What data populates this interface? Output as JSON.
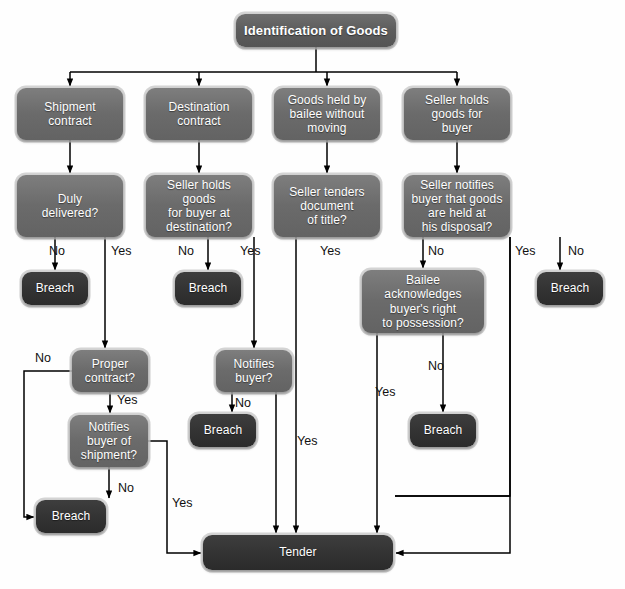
{
  "diagram": {
    "title_node": "Identification of Goods",
    "background": "#fefefe",
    "node_fill_gray": "#6b6b6b",
    "node_fill_dark": "#343434",
    "node_text_color": "#ffffff",
    "connector_color": "#000000"
  },
  "nodes": [
    {
      "id": "root",
      "label": "Identification of Goods",
      "style": "head",
      "x": 236,
      "y": 14,
      "w": 160,
      "h": 33,
      "font": 13
    },
    {
      "id": "b1",
      "label": "Shipment\ncontract",
      "style": "gray",
      "x": 17,
      "y": 88,
      "w": 106,
      "h": 52,
      "font": 12
    },
    {
      "id": "b2",
      "label": "Destination\ncontract",
      "style": "gray",
      "x": 146,
      "y": 88,
      "w": 106,
      "h": 52,
      "font": 12
    },
    {
      "id": "b3",
      "label": "Goods held by\nbailee without\nmoving",
      "style": "gray",
      "x": 274,
      "y": 88,
      "w": 106,
      "h": 52,
      "font": 12
    },
    {
      "id": "b4",
      "label": "Seller holds\ngoods for\nbuyer",
      "style": "gray",
      "x": 404,
      "y": 88,
      "w": 106,
      "h": 52,
      "font": 12
    },
    {
      "id": "q1",
      "label": "Duly\ndelivered?",
      "style": "gray",
      "x": 17,
      "y": 175,
      "w": 106,
      "h": 62,
      "font": 12
    },
    {
      "id": "q2",
      "label": "Seller holds goods\nfor buyer at\ndestination?",
      "style": "gray",
      "x": 146,
      "y": 175,
      "w": 106,
      "h": 62,
      "font": 12
    },
    {
      "id": "q3",
      "label": "Seller tenders\ndocument\nof title?",
      "style": "gray",
      "x": 274,
      "y": 175,
      "w": 106,
      "h": 62,
      "font": 12
    },
    {
      "id": "q4",
      "label": "Seller notifies\nbuyer that goods\nare held at\nhis disposal?",
      "style": "gray",
      "x": 404,
      "y": 175,
      "w": 106,
      "h": 62,
      "font": 12
    },
    {
      "id": "breach1",
      "label": "Breach",
      "style": "dark",
      "x": 22,
      "y": 272,
      "w": 66,
      "h": 33,
      "font": 12
    },
    {
      "id": "breach2",
      "label": "Breach",
      "style": "dark",
      "x": 175,
      "y": 272,
      "w": 66,
      "h": 33,
      "font": 12
    },
    {
      "id": "breach4",
      "label": "Breach",
      "style": "dark",
      "x": 537,
      "y": 272,
      "w": 66,
      "h": 33,
      "font": 12
    },
    {
      "id": "qbailee",
      "label": "Bailee\nacknowledges\nbuyer's right\nto possession?",
      "style": "gray",
      "x": 362,
      "y": 270,
      "w": 122,
      "h": 63,
      "font": 12
    },
    {
      "id": "qproper",
      "label": "Proper\ncontract?",
      "style": "gray",
      "x": 72,
      "y": 350,
      "w": 76,
      "h": 42,
      "font": 12
    },
    {
      "id": "qnotifies",
      "label": "Notifies\nbuyer?",
      "style": "gray",
      "x": 216,
      "y": 350,
      "w": 76,
      "h": 42,
      "font": 12
    },
    {
      "id": "breach3",
      "label": "Breach",
      "style": "dark",
      "x": 190,
      "y": 414,
      "w": 66,
      "h": 33,
      "font": 12
    },
    {
      "id": "breach5",
      "label": "Breach",
      "style": "dark",
      "x": 410,
      "y": 414,
      "w": 66,
      "h": 33,
      "font": 12
    },
    {
      "id": "qnotifyship",
      "label": "Notifies\nbuyer of\nshipment?",
      "style": "gray",
      "x": 70,
      "y": 415,
      "w": 78,
      "h": 52,
      "font": 12
    },
    {
      "id": "breach6",
      "label": "Breach",
      "style": "dark",
      "x": 36,
      "y": 500,
      "w": 70,
      "h": 33,
      "font": 12
    },
    {
      "id": "tender",
      "label": "Tender",
      "style": "dark",
      "x": 203,
      "y": 535,
      "w": 190,
      "h": 35,
      "font": 12
    }
  ],
  "edge_labels": [
    {
      "id": "el-q1-no",
      "text": "No",
      "x": 49,
      "y": 245
    },
    {
      "id": "el-q1-yes",
      "text": "Yes",
      "x": 111,
      "y": 245
    },
    {
      "id": "el-q2-no",
      "text": "No",
      "x": 178,
      "y": 245
    },
    {
      "id": "el-q2-yes",
      "text": "Yes",
      "x": 240,
      "y": 245
    },
    {
      "id": "el-q3-yes",
      "text": "Yes",
      "x": 320,
      "y": 245
    },
    {
      "id": "el-q3-no",
      "text": "No",
      "x": 428,
      "y": 245
    },
    {
      "id": "el-q4-yes",
      "text": "Yes",
      "x": 515,
      "y": 245
    },
    {
      "id": "el-q4-no",
      "text": "No",
      "x": 568,
      "y": 245
    },
    {
      "id": "el-proper-no",
      "text": "No",
      "x": 35,
      "y": 352
    },
    {
      "id": "el-proper-yes",
      "text": "Yes",
      "x": 117,
      "y": 394
    },
    {
      "id": "el-notifies-no",
      "text": "No",
      "x": 235,
      "y": 397
    },
    {
      "id": "el-notifies-yes",
      "text": "Yes",
      "x": 297,
      "y": 435
    },
    {
      "id": "el-bailee-yes",
      "text": "Yes",
      "x": 375,
      "y": 386
    },
    {
      "id": "el-bailee-no",
      "text": "No",
      "x": 428,
      "y": 360
    },
    {
      "id": "el-ship-no",
      "text": "No",
      "x": 118,
      "y": 482
    },
    {
      "id": "el-ship-yes",
      "text": "Yes",
      "x": 172,
      "y": 497
    }
  ],
  "chart_data": {
    "type": "flowchart",
    "title": "Identification of Goods",
    "connections": [
      {
        "from": "root",
        "to": "b1",
        "label": ""
      },
      {
        "from": "root",
        "to": "b2",
        "label": ""
      },
      {
        "from": "root",
        "to": "b3",
        "label": ""
      },
      {
        "from": "root",
        "to": "b4",
        "label": ""
      },
      {
        "from": "b1",
        "to": "q1",
        "label": ""
      },
      {
        "from": "b2",
        "to": "q2",
        "label": ""
      },
      {
        "from": "b3",
        "to": "q3",
        "label": ""
      },
      {
        "from": "b4",
        "to": "q4",
        "label": ""
      },
      {
        "from": "q1",
        "to": "breach1",
        "label": "No"
      },
      {
        "from": "q1",
        "to": "qproper",
        "label": "Yes"
      },
      {
        "from": "q2",
        "to": "breach2",
        "label": "No"
      },
      {
        "from": "q2",
        "to": "qnotifies",
        "label": "Yes"
      },
      {
        "from": "q3",
        "to": "tender",
        "label": "Yes"
      },
      {
        "from": "q3",
        "to": "qbailee",
        "label": "No"
      },
      {
        "from": "q4",
        "to": "tender",
        "label": "Yes"
      },
      {
        "from": "q4",
        "to": "breach4",
        "label": "No"
      },
      {
        "from": "qbailee",
        "to": "tender",
        "label": "Yes"
      },
      {
        "from": "qbailee",
        "to": "breach5",
        "label": "No"
      },
      {
        "from": "qproper",
        "to": "breach6",
        "label": "No"
      },
      {
        "from": "qproper",
        "to": "qnotifyship",
        "label": "Yes"
      },
      {
        "from": "qnotifies",
        "to": "breach3",
        "label": "No"
      },
      {
        "from": "qnotifies",
        "to": "tender",
        "label": "Yes"
      },
      {
        "from": "qnotifyship",
        "to": "breach6",
        "label": "No"
      },
      {
        "from": "qnotifyship",
        "to": "tender",
        "label": "Yes"
      }
    ]
  }
}
